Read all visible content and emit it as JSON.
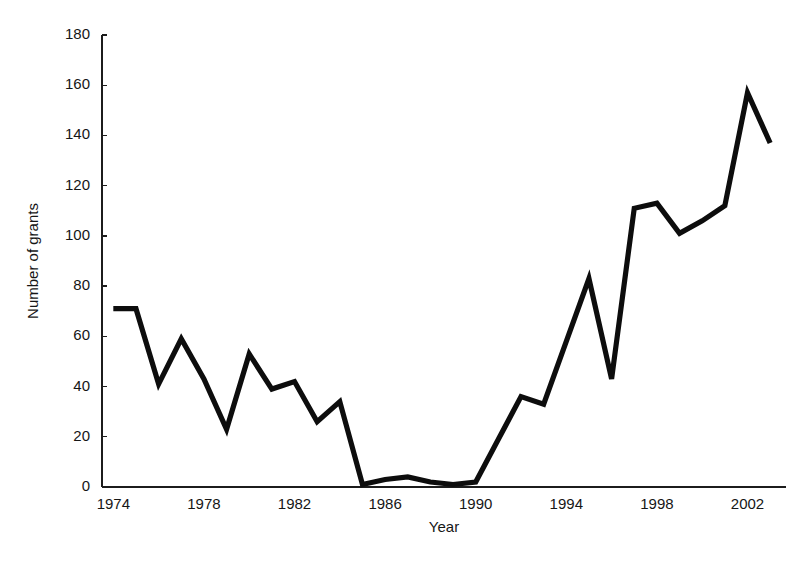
{
  "chart_data": {
    "type": "line",
    "title": "",
    "xlabel": "Year",
    "ylabel": "Number of grants",
    "xlim": [
      1973.5,
      2003.7
    ],
    "ylim": [
      0,
      180
    ],
    "grid": false,
    "legend": null,
    "yticks": [
      0,
      20,
      40,
      60,
      80,
      100,
      120,
      140,
      160,
      180
    ],
    "ytick_labels": [
      "0",
      "20",
      "40",
      "60",
      "80",
      "100",
      "120",
      "140",
      "160",
      "180"
    ],
    "xticks": [
      1974,
      1978,
      1982,
      1986,
      1990,
      1994,
      1998,
      2002
    ],
    "xtick_labels": [
      "1974",
      "1978",
      "1982",
      "1986",
      "1990",
      "1994",
      "1998",
      "2002"
    ],
    "line_color": "#0d0d0d",
    "x": [
      1974,
      1975,
      1976,
      1977,
      1978,
      1979,
      1980,
      1981,
      1982,
      1983,
      1984,
      1985,
      1986,
      1987,
      1988,
      1989,
      1990,
      1991,
      1992,
      1993,
      1994,
      1995,
      1996,
      1997,
      1998,
      1999,
      2000,
      2001,
      2002,
      2003
    ],
    "values": [
      71,
      71,
      41,
      59,
      43,
      23,
      53,
      39,
      42,
      26,
      34,
      1,
      3,
      4,
      2,
      1,
      2,
      19,
      36,
      33,
      58,
      83,
      43,
      111,
      113,
      101,
      106,
      112,
      157,
      137
    ],
    "series": [
      {
        "name": "Number of grants",
        "values": [
          71,
          71,
          41,
          59,
          43,
          23,
          53,
          39,
          42,
          26,
          34,
          1,
          3,
          4,
          2,
          1,
          2,
          19,
          36,
          33,
          58,
          83,
          43,
          111,
          113,
          101,
          106,
          112,
          157,
          137
        ]
      }
    ]
  },
  "axes": {
    "y_title": "Number of grants",
    "x_title": "Year"
  }
}
